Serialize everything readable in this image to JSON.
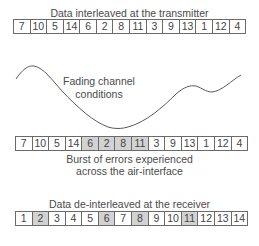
{
  "transmitter": {
    "title": "Data interleaved at the transmitter",
    "cells": [
      "7",
      "10",
      "5",
      "14",
      "6",
      "2",
      "8",
      "11",
      "3",
      "9",
      "13",
      "1",
      "12",
      "4"
    ],
    "error_indices": []
  },
  "channel": {
    "label_line1": "Fading channel",
    "label_line2": "conditions",
    "curve_color": "#5a5a5a"
  },
  "air_interface": {
    "cells": [
      "7",
      "10",
      "5",
      "14",
      "6",
      "2",
      "8",
      "11",
      "3",
      "9",
      "13",
      "1",
      "12",
      "4"
    ],
    "error_indices": [
      4,
      5,
      6,
      7
    ],
    "caption_line1": "Burst of errors experienced",
    "caption_line2": "across the air-interface"
  },
  "receiver": {
    "title": "Data de-interleaved at the receiver",
    "cells": [
      "1",
      "2",
      "3",
      "4",
      "5",
      "6",
      "7",
      "8",
      "9",
      "10",
      "11",
      "12",
      "13",
      "14"
    ],
    "error_indices": [
      1,
      5,
      7,
      10
    ]
  },
  "colors": {
    "error_fill": "#d2d2d2",
    "cell_border": "#6a6a6a",
    "text": "#4a4a4a"
  }
}
